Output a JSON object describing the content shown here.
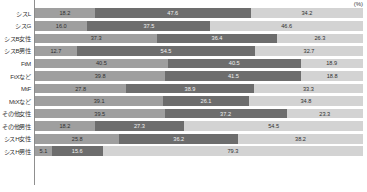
{
  "chart": {
    "unit_label": "(%)",
    "axis_name": "percent-axis"
  },
  "chart_data": {
    "type": "bar",
    "orientation": "horizontal",
    "stacked": true,
    "normalized": true,
    "title": "",
    "subtitle": "",
    "xlabel": "(%)",
    "ylabel": "",
    "xlim": [
      0,
      100
    ],
    "grid": false,
    "legend": null,
    "legend_position": "none",
    "categories": [
      "シスL",
      "シスG",
      "シスB女性",
      "シスB男性",
      "FtM",
      "FtXなど",
      "MtF",
      "MtXなど",
      "その他女性",
      "その他男性",
      "シスH女性",
      "シスH男性"
    ],
    "series": [
      {
        "name": "series-1",
        "color": "#9f9f9f",
        "values": [
          18.2,
          16.0,
          37.3,
          12.7,
          40.5,
          39.8,
          27.8,
          39.1,
          39.5,
          18.2,
          25.8,
          5.1
        ]
      },
      {
        "name": "series-2",
        "color": "#6d6d6d",
        "values": [
          47.6,
          37.5,
          36.4,
          54.5,
          40.5,
          41.5,
          38.9,
          26.1,
          37.2,
          27.3,
          36.2,
          15.6
        ]
      },
      {
        "name": "series-3",
        "color": "#d3d3d3",
        "values": [
          34.2,
          46.6,
          26.3,
          32.7,
          18.9,
          18.8,
          33.3,
          34.8,
          23.3,
          54.5,
          38.2,
          79.3
        ]
      }
    ],
    "rows": [
      {
        "label": "シスL",
        "segments": [
          {
            "value": "18.2",
            "pct": 18.2
          },
          {
            "value": "47.6",
            "pct": 47.6
          },
          {
            "value": "34.2",
            "pct": 34.2
          }
        ]
      },
      {
        "label": "シスG",
        "segments": [
          {
            "value": "16.0",
            "pct": 16.0
          },
          {
            "value": "37.5",
            "pct": 37.5
          },
          {
            "value": "46.6",
            "pct": 46.6
          }
        ]
      },
      {
        "label": "シスB女性",
        "segments": [
          {
            "value": "37.3",
            "pct": 37.3
          },
          {
            "value": "36.4",
            "pct": 36.4
          },
          {
            "value": "26.3",
            "pct": 26.3
          }
        ]
      },
      {
        "label": "シスB男性",
        "segments": [
          {
            "value": "12.7",
            "pct": 12.7
          },
          {
            "value": "54.5",
            "pct": 54.5
          },
          {
            "value": "32.7",
            "pct": 32.7
          }
        ]
      },
      {
        "label": "FtM",
        "segments": [
          {
            "value": "40.5",
            "pct": 40.5
          },
          {
            "value": "40.5",
            "pct": 40.5
          },
          {
            "value": "18.9",
            "pct": 18.9
          }
        ]
      },
      {
        "label": "FtXなど",
        "segments": [
          {
            "value": "39.8",
            "pct": 39.8
          },
          {
            "value": "41.5",
            "pct": 41.5
          },
          {
            "value": "18.8",
            "pct": 18.8
          }
        ]
      },
      {
        "label": "MtF",
        "segments": [
          {
            "value": "27.8",
            "pct": 27.8
          },
          {
            "value": "38.9",
            "pct": 38.9
          },
          {
            "value": "33.3",
            "pct": 33.3
          }
        ]
      },
      {
        "label": "MtXなど",
        "segments": [
          {
            "value": "39.1",
            "pct": 39.1
          },
          {
            "value": "26.1",
            "pct": 26.1
          },
          {
            "value": "34.8",
            "pct": 34.8
          }
        ]
      },
      {
        "label": "その他女性",
        "segments": [
          {
            "value": "39.5",
            "pct": 39.5
          },
          {
            "value": "37.2",
            "pct": 37.2
          },
          {
            "value": "23.3",
            "pct": 23.3
          }
        ]
      },
      {
        "label": "その他男性",
        "segments": [
          {
            "value": "18.2",
            "pct": 18.2
          },
          {
            "value": "27.3",
            "pct": 27.3
          },
          {
            "value": "54.5",
            "pct": 54.5
          }
        ]
      },
      {
        "label": "シスH女性",
        "segments": [
          {
            "value": "25.8",
            "pct": 25.8
          },
          {
            "value": "36.2",
            "pct": 36.2
          },
          {
            "value": "38.2",
            "pct": 38.2
          }
        ]
      },
      {
        "label": "シスH男性",
        "segments": [
          {
            "value": "5.1",
            "pct": 5.1
          },
          {
            "value": "15.6",
            "pct": 15.6
          },
          {
            "value": "79.3",
            "pct": 79.3
          }
        ]
      }
    ]
  }
}
